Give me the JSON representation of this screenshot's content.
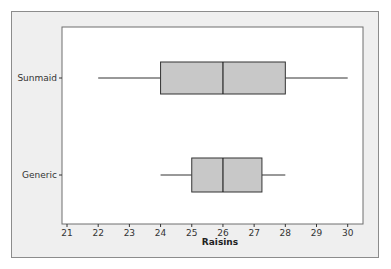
{
  "chart_data": {
    "type": "boxplot",
    "title": "",
    "xlabel": "Raisins",
    "ylabel": "",
    "xlim": [
      21,
      30
    ],
    "x_ticks": [
      21,
      22,
      23,
      24,
      25,
      26,
      27,
      28,
      29,
      30
    ],
    "grid": false,
    "orientation": "horizontal",
    "categories": [
      "Sunmaid",
      "Generic"
    ],
    "series": [
      {
        "name": "Sunmaid",
        "min": 22,
        "q1": 24,
        "median": 26,
        "q3": 28,
        "max": 30
      },
      {
        "name": "Generic",
        "min": 24,
        "q1": 25,
        "median": 26,
        "q3": 27.25,
        "max": 28
      }
    ],
    "colors": {
      "box_fill": "#c8c8c8",
      "frame_bg": "#efefef",
      "plot_bg": "#ffffff",
      "line": "#333333"
    }
  }
}
